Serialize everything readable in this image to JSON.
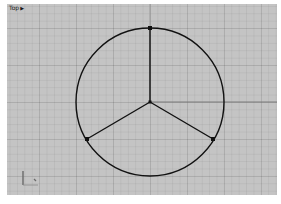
{
  "viewport": {
    "name": "Top",
    "menu_arrow": "▶"
  },
  "scene": {
    "circle": {
      "cx": 150,
      "cy": 102,
      "r": 74
    },
    "center_point": {
      "x": 150,
      "y": 102
    },
    "spoke_points": [
      {
        "x": 150,
        "y": 28
      },
      {
        "x": 87,
        "y": 139
      },
      {
        "x": 213,
        "y": 139
      }
    ]
  },
  "colors": {
    "viewport_bg": "#c4c4c4",
    "geometry": "#111111",
    "axis_x": "#7a7a7a",
    "axis_y": "#9a9a9a"
  }
}
